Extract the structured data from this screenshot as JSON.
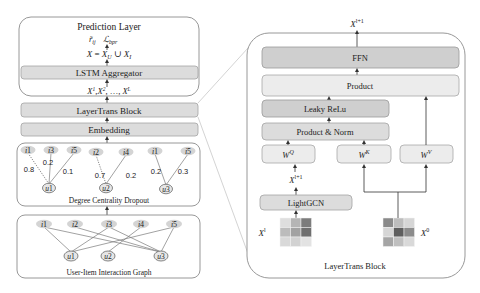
{
  "left_stack": {
    "prediction": {
      "title": "Prediction Layer",
      "outputs": [
        "r̃ᵢⱼ",
        "ℒ_bpr"
      ],
      "output_r": "r̃",
      "output_r_sub": "ij",
      "output_l": "ℒ",
      "output_l_sub": "bpr",
      "union_formula": {
        "lhs": "X",
        "eq": " = ",
        "xu": "X",
        "xu_sub": "U",
        "cup": " ∪ ",
        "xi": "X",
        "xi_sub": "I"
      },
      "aggregator_label": "LSTM Aggregator",
      "layer_outputs": {
        "x1": "X",
        "x1_sup": "1",
        "x2": "X",
        "x2_sup": "2",
        "ellipsis": ", …, ",
        "xl": "X",
        "xl_sup": "L",
        "sep": ","
      }
    },
    "layertrans_label": "LayerTrans Block",
    "embedding_label": "Embedding",
    "dropout": {
      "caption": "Degree Centrality Dropout",
      "groups": [
        {
          "user": "u1",
          "items": [
            {
              "label": "i1",
              "weight": "0.8",
              "dotted": true
            },
            {
              "label": "i3",
              "weight": "0.2",
              "dotted": false
            },
            {
              "label": "i5",
              "weight": "0.1",
              "dotted": false
            }
          ]
        },
        {
          "user": "u2",
          "items": [
            {
              "label": "i2",
              "weight": "0.7",
              "dotted": true
            },
            {
              "label": "i4",
              "weight": "0.2",
              "dotted": false
            }
          ]
        },
        {
          "user": "u3",
          "items": [
            {
              "label": "i1",
              "weight": "0.2",
              "dotted": false
            },
            {
              "label": "i5",
              "weight": "0.3",
              "dotted": false
            }
          ]
        }
      ]
    },
    "interaction_graph": {
      "caption": "User-Item Interaction Graph",
      "items": [
        "i1",
        "i2",
        "i3",
        "i4",
        "i5"
      ],
      "users": [
        "u1",
        "u2",
        "u3"
      ],
      "edges": [
        [
          "i1",
          "u1"
        ],
        [
          "i1",
          "u3"
        ],
        [
          "i2",
          "u3"
        ],
        [
          "i3",
          "u1"
        ],
        [
          "i3",
          "u3"
        ],
        [
          "i4",
          "u2"
        ],
        [
          "i5",
          "u1"
        ],
        [
          "i5",
          "u3"
        ]
      ]
    }
  },
  "layertrans_block": {
    "caption": "LayerTrans Block",
    "output_label": {
      "base": "X",
      "sup": "l+1"
    },
    "ffn_label": "FFN",
    "product_label": "Product",
    "leaky_relu_label": "Leaky ReLu",
    "product_norm_label": "Product & Norm",
    "wq": {
      "base": "W",
      "sup": "Q"
    },
    "wk": {
      "base": "W",
      "sup": "K"
    },
    "wv": {
      "base": "W",
      "sup": "V"
    },
    "intermediate_label": {
      "base": "X",
      "sup": "l+1"
    },
    "lightgcn_label": "LightGCN",
    "input_xl": {
      "base": "X",
      "sup": "l"
    },
    "input_x0": {
      "base": "X",
      "sup": "0"
    },
    "matrix_xl": [
      [
        "#dedede",
        "#b5b5b5",
        "#7c7c7c"
      ],
      [
        "#bcbcbc",
        "#a2a2a2",
        "#6f6f6f"
      ],
      [
        "#d9d9d9",
        "#d2d2d2",
        "#e3e3e3"
      ]
    ],
    "matrix_x0": [
      [
        "#8a8a8a",
        "#bdbdbd",
        "#d6d6d6"
      ],
      [
        "#d6d6d6",
        "#5e5e5e",
        "#8c8c8c"
      ],
      [
        "#a5a5a5",
        "#bfbfbf",
        "#d9d9d9"
      ]
    ]
  }
}
